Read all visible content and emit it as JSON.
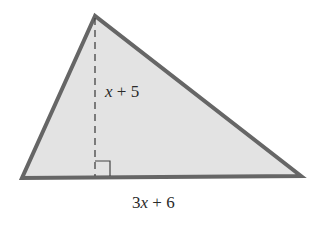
{
  "diagram": {
    "type": "triangle-with-altitude",
    "fill_color": "#e3e3e3",
    "stroke_color": "#666666",
    "height_label": {
      "var": "x",
      "rest": " + 5"
    },
    "base_label": {
      "coef": "3",
      "var": "x",
      "rest": " + 6"
    }
  }
}
